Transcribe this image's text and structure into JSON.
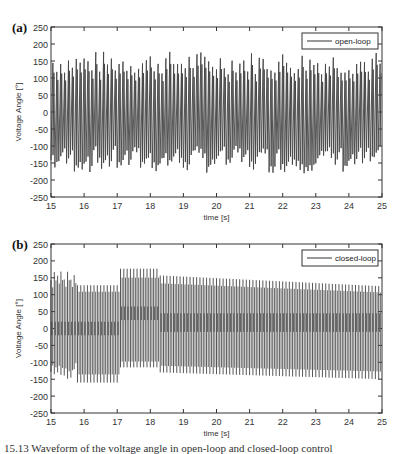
{
  "chart_data": [
    {
      "panel_label": "(a)",
      "type": "line",
      "title": "",
      "xlabel": "time [s]",
      "ylabel": "Voltage Angle [°]",
      "xlim": [
        15,
        25
      ],
      "ylim": [
        -250,
        250
      ],
      "xticks": [
        "15",
        "16",
        "17",
        "18",
        "19",
        "20",
        "21",
        "22",
        "23",
        "24",
        "25"
      ],
      "yticks": [
        "250",
        "200",
        "150",
        "100",
        "50",
        "0",
        "-50",
        "-100",
        "-150",
        "-200",
        "-250"
      ],
      "grid": false,
      "legend": {
        "position": "upper right",
        "entries": [
          "open-loop"
        ]
      },
      "series": [
        {
          "name": "open-loop",
          "description": "sawtooth-like oscillation of voltage angle, wrapping between about -175 and +175 degrees, irregular peak heights (roughly 110 to 180)",
          "approx_peak_range": [
            110,
            180
          ],
          "approx_trough_range": [
            -180,
            -110
          ],
          "approx_cycles": 85
        }
      ]
    },
    {
      "panel_label": "(b)",
      "type": "line",
      "title": "",
      "xlabel": "time [s]",
      "ylabel": "Voltage Angle [°]",
      "xlim": [
        15,
        25
      ],
      "ylim": [
        -250,
        250
      ],
      "xticks": [
        "15",
        "16",
        "17",
        "18",
        "19",
        "20",
        "21",
        "22",
        "23",
        "24",
        "25"
      ],
      "yticks": [
        "250",
        "200",
        "150",
        "100",
        "50",
        "0",
        "-50",
        "-100",
        "-150",
        "-200",
        "-250"
      ],
      "grid": false,
      "legend": {
        "position": "upper right",
        "entries": [
          "closed-loop"
        ]
      },
      "series": [
        {
          "name": "closed-loop",
          "description": "regular high-frequency oscillation; segments: 15-15.8 s transient (peaks up to ~170), 15.8-17.1 s peaks ~125/troughs ~-160, 17.1-18.3 s peaks ~175/troughs ~-115, 18.3-25 s peaks ~155 decaying to ~125 with troughs ~-130 decaying to ~-150",
          "segments": [
            {
              "t_start": 15.0,
              "t_end": 15.8,
              "upper": 170,
              "lower": -160,
              "inner_upper": 20,
              "inner_lower": -20
            },
            {
              "t_start": 15.8,
              "t_end": 17.1,
              "upper": 128,
              "lower": -160,
              "inner_upper": 20,
              "inner_lower": -20
            },
            {
              "t_start": 17.1,
              "t_end": 18.3,
              "upper": 177,
              "lower": -115,
              "inner_upper": 65,
              "inner_lower": 25
            },
            {
              "t_start": 18.3,
              "t_end": 25.0,
              "upper_start": 157,
              "upper_end": 125,
              "lower_start": -130,
              "lower_end": -150,
              "inner_upper": 45,
              "inner_lower": -10
            }
          ]
        }
      ]
    }
  ],
  "panels": {
    "a": {
      "label": "(a)",
      "legend": "open-loop",
      "xlabel": "time [s]",
      "ylabel": "Voltage Angle [°]"
    },
    "b": {
      "label": "(b)",
      "legend": "closed-loop",
      "xlabel": "time [s]",
      "ylabel": "Voltage Angle [°]"
    }
  },
  "caption": "15.13  Waveform of the voltage angle in open-loop and closed-loop control"
}
